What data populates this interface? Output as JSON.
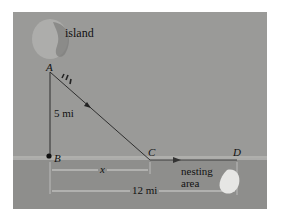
{
  "diagram": {
    "labels": {
      "island": "island",
      "point_a": "A",
      "point_b": "B",
      "point_c": "C",
      "point_d": "D",
      "distance_ab": "5 mi",
      "distance_bc": "x",
      "distance_bd": "12 mi",
      "nesting_line1": "nesting",
      "nesting_line2": "area"
    },
    "colors": {
      "land": "#9a9a98",
      "water": "#8e8e8c",
      "shore": "#b4b4b2",
      "line": "#222222",
      "dimension_line": "#c8c8c6",
      "nesting_area": "#e6e6e4"
    }
  }
}
